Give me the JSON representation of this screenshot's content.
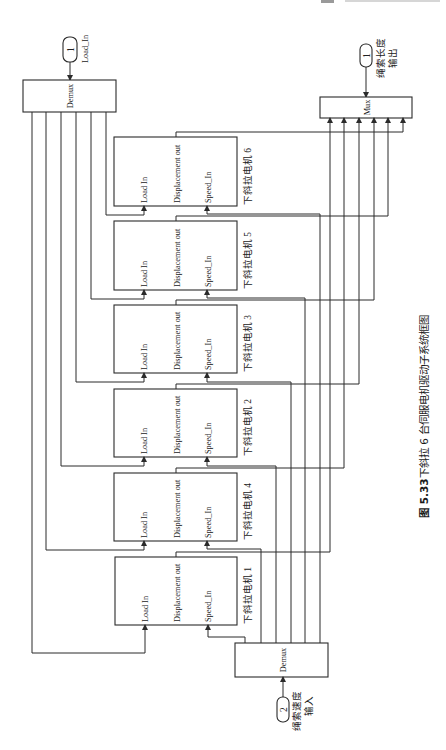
{
  "diagram": {
    "load_inport": {
      "number": "1",
      "label": "Load_In"
    },
    "top_demux": {
      "label": "Demux"
    },
    "mux": {
      "label": "Mux"
    },
    "length_outport": {
      "number": "1",
      "label_line1": "绳索长度",
      "label_line2": "输出"
    },
    "bottom_demux": {
      "label": "Demux"
    },
    "speed_inport": {
      "number": "2",
      "label_line1": "绳索速度",
      "label_line2": "输入"
    },
    "motors": [
      {
        "name": "下斜拉电机 6",
        "load_port": "Load In",
        "disp_port": "Displacement out",
        "speed_port": "Speed_In"
      },
      {
        "name": "下斜拉电机 5",
        "load_port": "Load In",
        "disp_port": "Displacement out",
        "speed_port": "Speed_In"
      },
      {
        "name": "下斜拉电机 3",
        "load_port": "Load In",
        "disp_port": "Displacement out",
        "speed_port": "Speed_In"
      },
      {
        "name": "下斜拉电机 2",
        "load_port": "Load In",
        "disp_port": "Displacement out",
        "speed_port": "Speed_In"
      },
      {
        "name": "下斜拉电机 4",
        "load_port": "Load In",
        "disp_port": "Displacement out",
        "speed_port": "Speed_In"
      },
      {
        "name": "下斜拉电机 1",
        "load_port": "Load In",
        "disp_port": "Displacement out",
        "speed_port": "Speed_In"
      }
    ]
  },
  "caption": {
    "figure_number": "图 5.33",
    "title": "下斜拉 6 台伺服电机驱动子系统框图"
  },
  "colors": {
    "line": "#2b2b2b",
    "background": "#ffffff"
  }
}
